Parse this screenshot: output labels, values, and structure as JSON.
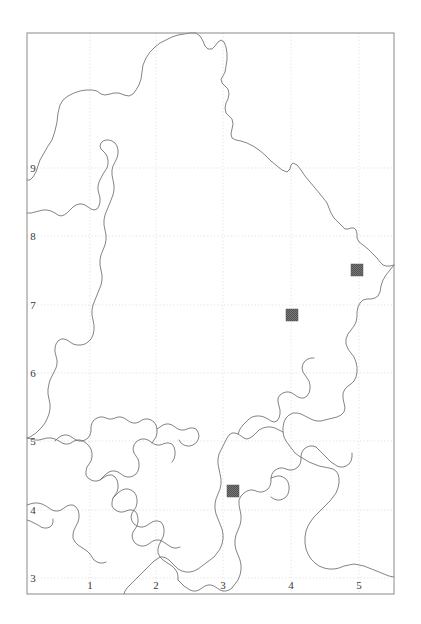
{
  "figure": {
    "type": "distribution-map",
    "title": "",
    "background_color": "#ffffff",
    "frame": {
      "color": "#8a8a8a",
      "left": 27,
      "top": 33,
      "right": 394,
      "bottom": 594
    }
  },
  "axes": {
    "x": {
      "label": "",
      "tick_labels": [
        "1",
        "2",
        "3",
        "4",
        "5"
      ],
      "tick_positions_px": [
        90,
        156,
        223,
        291,
        359
      ],
      "tick_label_y_px": 589
    },
    "y": {
      "label": "",
      "tick_labels": [
        "9",
        "8",
        "7",
        "6",
        "5",
        "4",
        "3"
      ],
      "tick_positions_px": [
        168,
        236,
        305,
        373,
        441,
        510,
        578
      ],
      "tick_label_x_px": 33
    },
    "grid": {
      "visible": true,
      "color": "#d9d2d2",
      "style": "dotted"
    }
  },
  "region_outline": {
    "stroke_color": "#6e6e6e",
    "fill": "none",
    "stroke_width": 0.8,
    "description": "administrative boundary outline"
  },
  "markers": [
    {
      "id": "record-1",
      "label": "",
      "grid_ref_x": 5.0,
      "grid_ref_y": 7.4,
      "x_px": 357,
      "y_px": 270,
      "size_px": 12,
      "color": "#6b6b6b",
      "symbol": "filled-square"
    },
    {
      "id": "record-2",
      "label": "",
      "grid_ref_x": 3.95,
      "grid_ref_y": 7.1,
      "x_px": 292,
      "y_px": 315,
      "size_px": 12,
      "color": "#6b6b6b",
      "symbol": "filled-square"
    },
    {
      "id": "record-3",
      "label": "",
      "grid_ref_x": 3.15,
      "grid_ref_y": 4.25,
      "x_px": 233,
      "y_px": 491,
      "size_px": 12,
      "color": "#6b6b6b",
      "symbol": "filled-square"
    }
  ],
  "legend": {
    "visible": false,
    "entries": []
  }
}
